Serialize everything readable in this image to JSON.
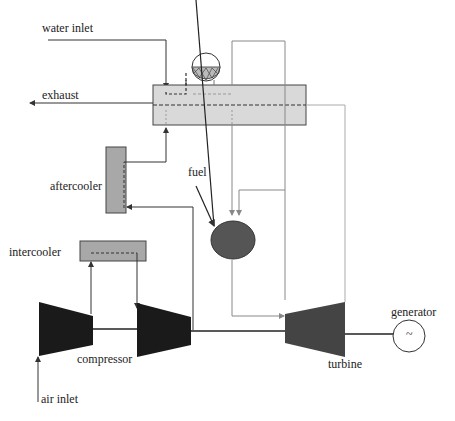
{
  "labels": {
    "water_inlet": "water inlet",
    "exhaust": "exhaust",
    "aftercooler": "aftercooler",
    "fuel": "fuel",
    "intercooler": "intercooler",
    "compressor": "compressor",
    "turbine": "turbine",
    "generator": "generator",
    "generator_symbol": "~",
    "air_inlet": "air inlet"
  },
  "colors": {
    "component_fill": "#d9d9d9",
    "cooler_fill": "#a8a8a8",
    "combustor_fill": "#555555",
    "compressor_fill": "#1a1a1a",
    "turbine_fill": "#444444",
    "line": "#333333",
    "light_line": "#999999"
  }
}
